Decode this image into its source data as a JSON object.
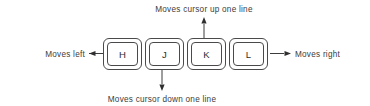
{
  "diagram": {
    "title_text": "",
    "canvas": {
      "width": 370,
      "height": 106,
      "background": "#ffffff"
    },
    "stroke_color": "#3c3c3c",
    "key_border_color": "#4a4a4a",
    "key_face_color": "#ffffff",
    "text_color": "#3c3c3c",
    "keys": [
      {
        "id": "h",
        "label": "H",
        "direction": "left",
        "annotation": "Moves left"
      },
      {
        "id": "j",
        "label": "J",
        "direction": "down",
        "annotation": "Moves cursor down one line"
      },
      {
        "id": "k",
        "label": "K",
        "direction": "up",
        "annotation": "Moves cursor up one line"
      },
      {
        "id": "l",
        "label": "L",
        "direction": "right",
        "annotation": "Moves right"
      }
    ],
    "labels": {
      "top": "Moves cursor up one line",
      "bottom": "Moves cursor down one line",
      "left": "Moves left",
      "right": "Moves right"
    }
  }
}
